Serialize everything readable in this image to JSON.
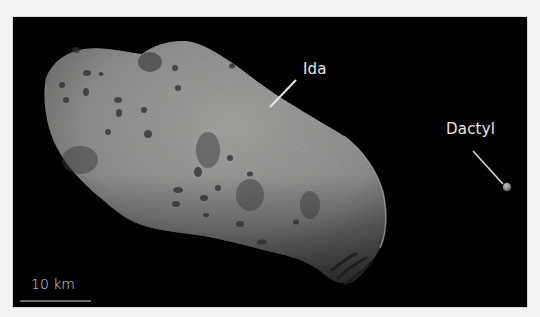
{
  "figure": {
    "colors": {
      "background": "#000000",
      "frame": "#f2f2f0",
      "label_text": "#e8e8e8",
      "asteroid_surface": "#8c8c8c"
    },
    "labels": {
      "ida": "Ida",
      "dactyl": "Dactyl"
    },
    "scale_bar": {
      "text": "10 km"
    }
  }
}
